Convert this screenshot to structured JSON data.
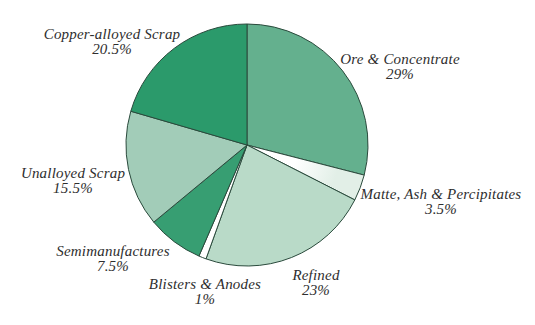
{
  "page": {
    "background_color": "#ffffff"
  },
  "chart_data": {
    "type": "pie",
    "title": "",
    "legend": "none",
    "labels_layout": "outside",
    "start_angle_deg": 0,
    "direction": "clockwise",
    "outline_color": "#2a4a3c",
    "slices": [
      {
        "id": "ore-concentrate",
        "label": "Ore & Concentrate",
        "pct_label": "29%",
        "value": 29,
        "color": "#64b08e"
      },
      {
        "id": "matte-ash-percipitates",
        "label": "Matte, Ash & Percipitates",
        "pct_label": "3.5%",
        "value": 3.5,
        "color": "#e2efe7",
        "center_fade": true
      },
      {
        "id": "refined",
        "label": "Refined",
        "pct_label": "23%",
        "value": 23,
        "color": "#b9dac8"
      },
      {
        "id": "blisters-anodes",
        "label": "Blisters & Anodes",
        "pct_label": "1%",
        "value": 1,
        "color": "#ffffff"
      },
      {
        "id": "semimanufactures",
        "label": "Semimanufactures",
        "pct_label": "7.5%",
        "value": 7.5,
        "color": "#379e72"
      },
      {
        "id": "unalloyed-scrap",
        "label": "Unalloyed Scrap",
        "pct_label": "15.5%",
        "value": 15.5,
        "color": "#a2ccb8"
      },
      {
        "id": "copper-alloyed-scrap",
        "label": "Copper-alloyed Scrap",
        "pct_label": "20.5%",
        "value": 20.5,
        "color": "#2b9a6b"
      }
    ]
  }
}
